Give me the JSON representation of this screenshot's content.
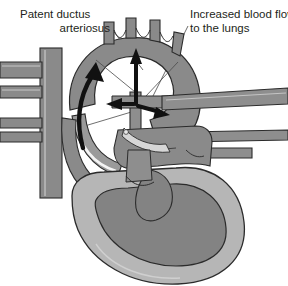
{
  "figure": {
    "background_color": "#ffffff"
  },
  "labels": {
    "left": {
      "name": "patent-ductus-arteriosus-label",
      "line1": "Patent ductus",
      "line2": "arteriosus"
    },
    "right": {
      "name": "increased-blood-flow-label",
      "line1": "Increased blood flow",
      "line2": "to the lungs"
    }
  },
  "colors": {
    "vessel_dark": "#7e7e7e",
    "vessel_mid": "#8c8c8c",
    "chamber_dark": "#838383",
    "myocardium_light": "#b6b6b6",
    "outline": "#2b2b2b",
    "highlight": "#f2f2f2",
    "arrow": "#111111",
    "leader": "#5a5a5a",
    "text": "#231f20"
  },
  "annotations": {
    "arrows": [
      {
        "name": "ductus-flow-arrow",
        "direction": "up-left-curved"
      },
      {
        "name": "pulmonary-trunk-up-arrow",
        "direction": "up"
      },
      {
        "name": "left-pulmonary-artery-arrow",
        "direction": "left"
      },
      {
        "name": "right-pulmonary-artery-arrow",
        "direction": "right"
      }
    ]
  },
  "structures": [
    {
      "name": "aortic-arch"
    },
    {
      "name": "brachiocephalic-branches"
    },
    {
      "name": "ductus-arteriosus"
    },
    {
      "name": "pulmonary-trunk"
    },
    {
      "name": "descending-aorta"
    },
    {
      "name": "superior-vena-cava"
    },
    {
      "name": "pulmonary-veins"
    },
    {
      "name": "left-ventricle"
    },
    {
      "name": "right-ventricle"
    },
    {
      "name": "left-atrium"
    },
    {
      "name": "heart-apex"
    }
  ]
}
